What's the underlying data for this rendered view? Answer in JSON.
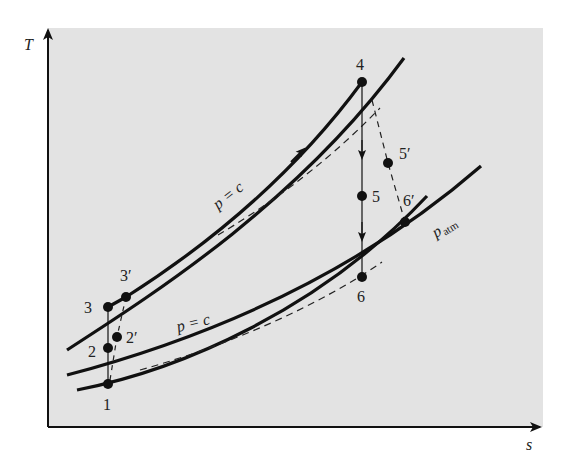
{
  "diagram": {
    "type": "T-s diagram (gas turbine / Brayton cycle with intercooling and reheat)",
    "axes": {
      "y_label": "T",
      "x_label": "s"
    },
    "curve_labels": {
      "upper_pressure": "p = c",
      "lower_pressure": "p = c",
      "atmospheric_pressure_main": "p",
      "atmospheric_pressure_sub": "atm"
    },
    "points": [
      {
        "id": "1",
        "label": "1"
      },
      {
        "id": "2",
        "label": "2"
      },
      {
        "id": "2p",
        "label": "2′"
      },
      {
        "id": "3",
        "label": "3"
      },
      {
        "id": "3p",
        "label": "3′"
      },
      {
        "id": "4",
        "label": "4"
      },
      {
        "id": "5",
        "label": "5"
      },
      {
        "id": "5p",
        "label": "5′"
      },
      {
        "id": "6",
        "label": "6"
      },
      {
        "id": "6p",
        "label": "6′"
      }
    ],
    "colors": {
      "panel": "#e3e3e3",
      "ink": "#111111",
      "background": "#ffffff"
    }
  }
}
